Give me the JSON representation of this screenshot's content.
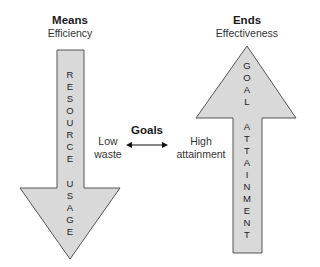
{
  "left": {
    "title": "Means",
    "subtitle": "Efficiency",
    "arrow_direction": "down",
    "arrow_words": [
      "RESOURCE",
      "USAGE"
    ]
  },
  "right": {
    "title": "Ends",
    "subtitle": "Effectiveness",
    "arrow_direction": "up",
    "arrow_words": [
      "GOAL",
      "ATTAINMENT"
    ]
  },
  "center": {
    "title": "Goals",
    "left_label_line1": "Low",
    "left_label_line2": "waste",
    "right_label_line1": "High",
    "right_label_line2": "attainment"
  },
  "colors": {
    "arrow_fill": "#d9d9d9",
    "arrow_stroke": "#555555"
  }
}
